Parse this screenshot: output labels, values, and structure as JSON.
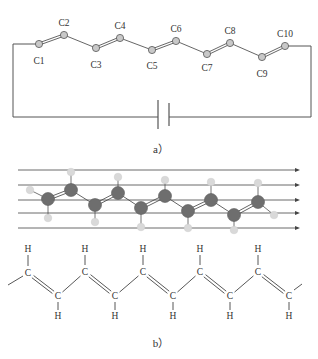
{
  "panel_a": {
    "caption": "a）",
    "atoms": [
      {
        "label": "C1",
        "x": 39,
        "y": 44,
        "lx": 39,
        "ly": 64
      },
      {
        "label": "C2",
        "x": 64,
        "y": 35,
        "lx": 64,
        "ly": 26
      },
      {
        "label": "C3",
        "x": 96,
        "y": 48,
        "lx": 96,
        "ly": 68
      },
      {
        "label": "C4",
        "x": 120,
        "y": 38,
        "lx": 120,
        "ly": 29
      },
      {
        "label": "C5",
        "x": 152,
        "y": 50,
        "lx": 152,
        "ly": 69
      },
      {
        "label": "C6",
        "x": 176,
        "y": 41,
        "lx": 176,
        "ly": 32
      },
      {
        "label": "C7",
        "x": 207,
        "y": 54,
        "lx": 207,
        "ly": 71
      },
      {
        "label": "C8",
        "x": 230,
        "y": 43,
        "lx": 230,
        "ly": 34
      },
      {
        "label": "C9",
        "x": 262,
        "y": 57,
        "lx": 262,
        "ly": 77
      },
      {
        "label": "C10",
        "x": 285,
        "y": 46,
        "lx": 285,
        "ly": 37
      }
    ],
    "double_bonds": [
      [
        0,
        1
      ],
      [
        2,
        3
      ],
      [
        4,
        5
      ],
      [
        6,
        7
      ],
      [
        8,
        9
      ]
    ],
    "single_bonds": [
      [
        1,
        2
      ],
      [
        3,
        4
      ],
      [
        5,
        6
      ],
      [
        7,
        8
      ]
    ],
    "circuit": {
      "left": 13,
      "right": 311,
      "top_left_y": 45,
      "bottom_y": 117,
      "cap_left_x": 158,
      "cap_right_x": 169,
      "cap_top": 100,
      "cap_bottom": 129
    }
  },
  "panel_b": {
    "caption": "b）",
    "field_lines_y": [
      170,
      185,
      200,
      213,
      228
    ],
    "field_x_start": 18,
    "field_x_end": 300,
    "carbons": [
      [
        48,
        199
      ],
      [
        71,
        190
      ],
      [
        95,
        205
      ],
      [
        118,
        193
      ],
      [
        141,
        208
      ],
      [
        165,
        196
      ],
      [
        188,
        211
      ],
      [
        211,
        200
      ],
      [
        234,
        215
      ],
      [
        258,
        202
      ]
    ],
    "hydrogens": [
      [
        30,
        190,
        0
      ],
      [
        48,
        218,
        0
      ],
      [
        71,
        172,
        1
      ],
      [
        95,
        222,
        2
      ],
      [
        118,
        177,
        3
      ],
      [
        141,
        227,
        4
      ],
      [
        165,
        180,
        5
      ],
      [
        188,
        228,
        6
      ],
      [
        211,
        182,
        7
      ],
      [
        234,
        230,
        8
      ],
      [
        258,
        183,
        9
      ],
      [
        274,
        215,
        9
      ]
    ],
    "structure": {
      "top_carbons": [
        [
          28,
          273
        ],
        [
          85,
          272
        ],
        [
          143,
          272
        ],
        [
          200,
          272
        ],
        [
          258,
          272
        ]
      ],
      "bottom_carbons": [
        [
          58,
          296
        ],
        [
          115,
          296
        ],
        [
          173,
          296
        ],
        [
          230,
          296
        ],
        [
          289,
          296
        ]
      ],
      "atom_label_c": "C",
      "atom_label_h": "H",
      "top_h_y": 252,
      "bottom_h_y": 319
    }
  },
  "colors": {
    "line": "#555555",
    "atom_a_fill": "#c8c8c8",
    "atom_a_stroke": "#555555",
    "carbon_fill": "#6e6e6e",
    "hydrogen_fill": "#d9d9d9",
    "field_line": "#444444"
  }
}
